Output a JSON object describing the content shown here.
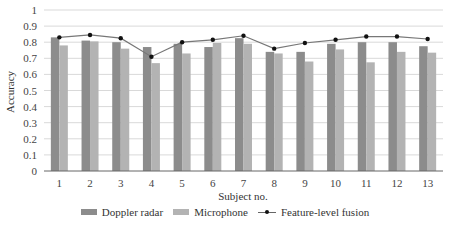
{
  "chart_data": {
    "type": "bar",
    "title": "",
    "xlabel": "Subject no.",
    "ylabel": "Accuracy",
    "ylim": [
      0,
      1
    ],
    "yticks": [
      0,
      0.1,
      0.2,
      0.3,
      0.4,
      0.5,
      0.6,
      0.7,
      0.8,
      0.9,
      1
    ],
    "ytick_labels": [
      "0",
      "0.1",
      "0.2",
      "0.3",
      "0.4",
      "0.5",
      "0.6",
      "0.7",
      "0.8",
      "0.9",
      "1"
    ],
    "grid": true,
    "legend_position": "bottom",
    "categories": [
      "1",
      "2",
      "3",
      "4",
      "5",
      "6",
      "7",
      "8",
      "9",
      "10",
      "11",
      "12",
      "13"
    ],
    "series": [
      {
        "name": "Doppler radar",
        "type": "bar",
        "color": "#8c8c8c",
        "values": [
          0.83,
          0.81,
          0.8,
          0.77,
          0.79,
          0.77,
          0.825,
          0.74,
          0.74,
          0.79,
          0.8,
          0.8,
          0.775
        ]
      },
      {
        "name": "Microphone",
        "type": "bar",
        "color": "#b3b3b3",
        "values": [
          0.78,
          0.805,
          0.76,
          0.67,
          0.73,
          0.795,
          0.79,
          0.73,
          0.68,
          0.755,
          0.675,
          0.74,
          0.735
        ]
      },
      {
        "name": "Feature-level fusion",
        "type": "line",
        "color": "#777777",
        "marker_color": "#111111",
        "values": [
          0.83,
          0.845,
          0.825,
          0.71,
          0.8,
          0.815,
          0.84,
          0.76,
          0.795,
          0.815,
          0.835,
          0.835,
          0.82
        ]
      }
    ]
  }
}
